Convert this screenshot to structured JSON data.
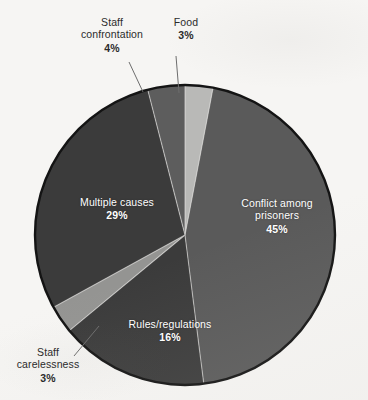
{
  "background_color": "#f6f5f3",
  "chart_data": {
    "type": "pie",
    "title": "",
    "subtitle": "",
    "xlabel": "",
    "ylabel": "",
    "legend_position": "none",
    "grid": false,
    "units": "percent",
    "center": {
      "x": 185,
      "y": 235,
      "radius": 150
    },
    "start_angle_deg": 0,
    "direction": "clockwise",
    "outline_color": "#141414",
    "categories": [
      "Food",
      "Conflict among prisoners",
      "Rules/regulations",
      "Staff carelessness",
      "Multiple causes",
      "Staff confrontation"
    ],
    "values": [
      3,
      45,
      16,
      3,
      29,
      4
    ],
    "slices": [
      {
        "name": "Food",
        "label_lines": [
          "Food"
        ],
        "percent_text": "3%",
        "value": 3,
        "color": "#b9b9b7",
        "label_placement": "outside",
        "label_color": "#2b2b2b",
        "leader_line": true
      },
      {
        "name": "Conflict among prisoners",
        "label_lines": [
          "Conflict among",
          "prisoners"
        ],
        "percent_text": "45%",
        "value": 45,
        "color": "#5a5a5a",
        "label_placement": "inside",
        "label_color": "#ffffff",
        "leader_line": false
      },
      {
        "name": "Rules/regulations",
        "label_lines": [
          "Rules/regulations"
        ],
        "percent_text": "16%",
        "value": 16,
        "color": "#3b3b3b",
        "label_placement": "inside",
        "label_color": "#ffffff",
        "leader_line": false
      },
      {
        "name": "Staff carelessness",
        "label_lines": [
          "Staff",
          "carelessness"
        ],
        "percent_text": "3%",
        "value": 3,
        "color": "#949492",
        "label_placement": "outside",
        "label_color": "#2b2b2b",
        "leader_line": true
      },
      {
        "name": "Multiple causes",
        "label_lines": [
          "Multiple causes"
        ],
        "percent_text": "29%",
        "value": 29,
        "color": "#3b3b3b",
        "label_placement": "inside",
        "label_color": "#ffffff",
        "leader_line": false
      },
      {
        "name": "Staff confrontation",
        "label_lines": [
          "Staff",
          "confrontation"
        ],
        "percent_text": "4%",
        "value": 4,
        "color": "#5d5d5d",
        "label_placement": "outside",
        "label_color": "#2b2b2b",
        "leader_line": true
      }
    ]
  },
  "labels": {
    "conflict": {
      "line1": "Conflict among",
      "line2": "prisoners",
      "pct": "45%"
    },
    "multiple": {
      "line1": "Multiple causes",
      "pct": "29%"
    },
    "rules": {
      "line1": "Rules/regulations",
      "pct": "16%"
    },
    "staff_confrontation": {
      "line1": "Staff",
      "line2": "confrontation",
      "pct": "4%"
    },
    "food": {
      "line1": "Food",
      "pct": "3%"
    },
    "staff_carelessness": {
      "line1": "Staff",
      "line2": "carelessness",
      "pct": "3%"
    }
  }
}
